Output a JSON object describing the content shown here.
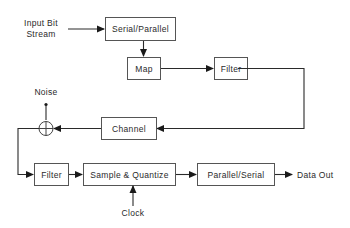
{
  "diagram": {
    "inputs": {
      "input_bit_stream": [
        "Input Bit",
        "Stream"
      ],
      "noise": "Noise",
      "clock": "Clock"
    },
    "outputs": {
      "data_out": "Data Out"
    },
    "blocks": {
      "serial_parallel": "Serial/Parallel",
      "map": "Map",
      "filter_tx": "Filter",
      "channel": "Channel",
      "filter_rx": "Filter",
      "sample_quantize": "Sample & Quantize",
      "parallel_serial": "Parallel/Serial"
    },
    "summing_junction": "adder",
    "flow": [
      "Input Bit Stream -> Serial/Parallel",
      "Serial/Parallel -> Map",
      "Map -> Filter",
      "Filter -> Channel",
      "Channel -> Adder",
      "Noise -> Adder",
      "Adder -> Filter",
      "Filter -> Sample & Quantize",
      "Clock -> Sample & Quantize",
      "Sample & Quantize -> Parallel/Serial",
      "Parallel/Serial -> Data Out"
    ]
  }
}
